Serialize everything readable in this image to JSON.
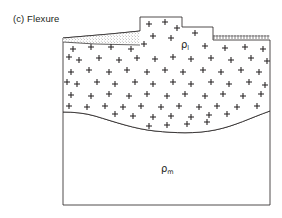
{
  "figure": {
    "caption": "(c) Flexure",
    "panel_letter": "(c)",
    "panel_title": "Flexure",
    "background_color": "#ffffff",
    "line_color": "#231f20"
  },
  "labels": {
    "load_density": {
      "symbol": "ρ",
      "subscript": "l",
      "full": "ρl",
      "x": 185,
      "y": 46
    },
    "mantle_density": {
      "symbol": "ρ",
      "subscript": "m",
      "full": "ρm",
      "x": 165,
      "y": 170
    }
  },
  "layers": [
    {
      "name": "crust-load",
      "label": "ρl",
      "fill": "#ffffff",
      "ornament": "plus-symbols",
      "description": "Crustal block with plus-sign crystalline ornament"
    },
    {
      "name": "mantle",
      "label": "ρm",
      "fill": "#ffffff",
      "ornament": "none",
      "description": "Mantle below flexed crust-mantle boundary"
    },
    {
      "name": "sediment-wedge",
      "label": "",
      "fill": "#ffffff",
      "ornament": "stipple",
      "description": "Stippled sediment wedge in left flexural moat"
    },
    {
      "name": "erosion-surface",
      "label": "",
      "fill": "none",
      "ornament": "tick-hatch",
      "description": "Eroded / hatched land surface on right flank"
    }
  ],
  "geometry": {
    "block_left": 63,
    "block_right": 270,
    "block_bottom": 205,
    "plateau_top_y": 17,
    "plateau_step_y": 27,
    "plateau_left_x": 140,
    "plateau_step_x": 182,
    "plateau_right_x": 213,
    "surface_left_y": 38,
    "surface_right_y": 40,
    "moho_left_y": 112,
    "moho_deepest_y": 131,
    "moho_right_y": 111
  },
  "ornament_counts": {
    "plus_symbols": 96,
    "stipple_dots": 150
  }
}
